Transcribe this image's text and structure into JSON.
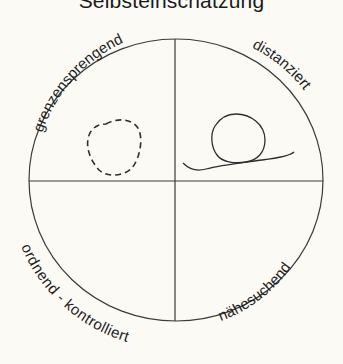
{
  "title": "Selbsteinschätzung",
  "quadrants": {
    "top_left": "grenzensprengend",
    "top_right": "distanziert",
    "bottom_left": "ordnend - kontrolliert",
    "bottom_right": "nähesuchend"
  },
  "drawings": [
    {
      "quadrant": "top_left",
      "shape": "circle",
      "style": "dashed"
    },
    {
      "quadrant": "top_right",
      "shape": "circle-on-line",
      "style": "solid"
    }
  ],
  "colors": {
    "background": "#fbfaf4",
    "stroke": "#3a3a3a",
    "text": "#1e1e1e"
  }
}
